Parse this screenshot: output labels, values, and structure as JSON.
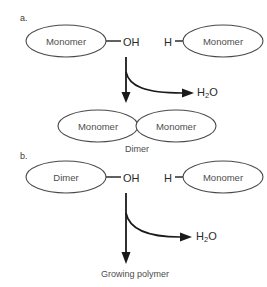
{
  "diagram": {
    "title_steps": {
      "step_a": "a.",
      "step_b": "b."
    },
    "reaction_a": {
      "left_unit": "Monomer",
      "left_group": "OH",
      "right_group": "H",
      "right_unit": "Monomer",
      "byproduct": "H",
      "byproduct_sub": "2",
      "byproduct_tail": "O",
      "product_left": "Monomer",
      "product_right": "Monomer",
      "product_caption": "Dimer"
    },
    "reaction_b": {
      "left_unit": "Dimer",
      "left_group": "OH",
      "right_group": "H",
      "right_unit": "Monomer",
      "byproduct": "H",
      "byproduct_sub": "2",
      "byproduct_tail": "O",
      "product_caption": "Growing polymer"
    },
    "colors": {
      "ellipse_stroke": "#4a4a4a",
      "ellipse_fill": "#ffffff",
      "label_text": "#4d4d4d",
      "arrow": "#1a1a1a",
      "background": "#ffffff"
    }
  }
}
